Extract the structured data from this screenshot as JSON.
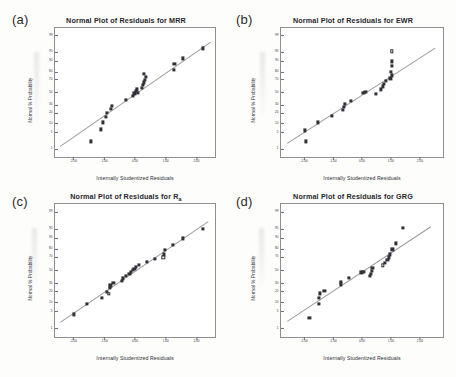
{
  "figure": {
    "background": "#fdfdfc",
    "marker_color": "#303036",
    "line_color": "#9a9aa0",
    "frame_color": "#8d8d92",
    "common_xlabel": "Internally Studentized Residuals",
    "common_ylabel": "Normal % Probability"
  },
  "chart_data": [
    {
      "type": "scatter",
      "panel": "(a)",
      "title": "Normal Plot of Residuals for MRR",
      "title_main": "Normal Plot of Residuals for MRR",
      "xlabel": "Internally Studentized Residuals",
      "ylabel": "Normal % Probability",
      "xlim": [
        -2.6,
        2.6
      ],
      "ylim": [
        0.4,
        99.6
      ],
      "yscale": "normal-probability",
      "grid": false,
      "legend": "none",
      "xticks": [
        "-2.00",
        "-1.00",
        "0.00",
        "1.00",
        "2.00"
      ],
      "xtickvals": [
        -2,
        -1,
        0,
        1,
        2
      ],
      "yticks": [
        "1",
        "5",
        "10",
        "20",
        "30",
        "50",
        "70",
        "80",
        "90",
        "95",
        "99"
      ],
      "ytickvals": [
        1,
        5,
        10,
        20,
        30,
        50,
        70,
        80,
        90,
        95,
        99
      ],
      "reference_line": {
        "x0": -2.45,
        "y0": 1.4,
        "x1": 2.45,
        "y1": 98.2
      },
      "points": [
        {
          "x": -1.42,
          "y": 2.2,
          "open": false
        },
        {
          "x": -1.1,
          "y": 6.5,
          "open": false
        },
        {
          "x": -1.05,
          "y": 11.0,
          "open": false
        },
        {
          "x": -0.94,
          "y": 16.0,
          "open": false
        },
        {
          "x": -0.9,
          "y": 20.5,
          "open": false
        },
        {
          "x": -0.78,
          "y": 25.0,
          "open": false
        },
        {
          "x": -0.74,
          "y": 29.0,
          "open": false
        },
        {
          "x": -0.3,
          "y": 38.0,
          "open": false
        },
        {
          "x": -0.08,
          "y": 44.0,
          "open": false
        },
        {
          "x": -0.02,
          "y": 48.5,
          "open": false
        },
        {
          "x": 0.02,
          "y": 52.0,
          "open": false
        },
        {
          "x": 0.05,
          "y": 55.0,
          "open": false
        },
        {
          "x": 0.1,
          "y": 50.0,
          "open": false
        },
        {
          "x": 0.22,
          "y": 58.0,
          "open": false
        },
        {
          "x": 0.26,
          "y": 62.0,
          "open": false
        },
        {
          "x": 0.3,
          "y": 66.0,
          "open": false
        },
        {
          "x": 0.33,
          "y": 70.0,
          "open": false
        },
        {
          "x": 0.35,
          "y": 74.0,
          "open": false
        },
        {
          "x": 0.28,
          "y": 78.0,
          "open": false
        },
        {
          "x": 1.26,
          "y": 82.0,
          "open": false
        },
        {
          "x": 1.28,
          "y": 88.0,
          "open": false
        },
        {
          "x": 1.55,
          "y": 92.0,
          "open": false
        },
        {
          "x": 2.22,
          "y": 96.5,
          "open": false
        }
      ]
    },
    {
      "type": "scatter",
      "panel": "(b)",
      "title": "Normal Plot of Residuals for EWR",
      "title_main": "Normal Plot of Residuals for EWR",
      "xlabel": "Internally Studentized Residuals",
      "ylabel": "Normal % Probability",
      "xlim": [
        -2.8,
        2.8
      ],
      "ylim": [
        0.4,
        99.6
      ],
      "yscale": "normal-probability",
      "grid": false,
      "legend": "none",
      "xticks": [
        "-2.00",
        "-1.00",
        "0.00",
        "1.00",
        "2.00"
      ],
      "xtickvals": [
        -2,
        -1,
        0,
        1,
        2
      ],
      "yticks": [
        "1",
        "5",
        "10",
        "20",
        "30",
        "50",
        "70",
        "80",
        "90",
        "95",
        "99"
      ],
      "ytickvals": [
        1,
        5,
        10,
        20,
        30,
        50,
        70,
        80,
        90,
        95,
        99
      ],
      "reference_line": {
        "x0": -2.6,
        "y0": 1.8,
        "x1": 2.5,
        "y1": 96.5
      },
      "points": [
        {
          "x": -1.95,
          "y": 2.2,
          "open": false
        },
        {
          "x": -1.98,
          "y": 6.0,
          "open": false
        },
        {
          "x": -1.52,
          "y": 11.0,
          "open": false
        },
        {
          "x": -1.05,
          "y": 16.5,
          "open": false
        },
        {
          "x": -0.66,
          "y": 24.0,
          "open": false
        },
        {
          "x": -0.62,
          "y": 28.0,
          "open": false
        },
        {
          "x": -0.6,
          "y": 32.0,
          "open": false
        },
        {
          "x": -0.38,
          "y": 37.0,
          "open": false
        },
        {
          "x": 0.05,
          "y": 50.0,
          "open": false
        },
        {
          "x": 0.12,
          "y": 50.5,
          "open": false
        },
        {
          "x": 0.48,
          "y": 48.0,
          "open": false
        },
        {
          "x": 0.66,
          "y": 55.0,
          "open": false
        },
        {
          "x": 0.72,
          "y": 60.0,
          "open": false
        },
        {
          "x": 0.76,
          "y": 64.0,
          "open": false
        },
        {
          "x": 0.82,
          "y": 68.0,
          "open": false
        },
        {
          "x": 0.98,
          "y": 72.0,
          "open": false
        },
        {
          "x": 1.02,
          "y": 76.0,
          "open": false
        },
        {
          "x": 1.0,
          "y": 80.0,
          "open": false
        },
        {
          "x": 1.04,
          "y": 86.0,
          "open": false
        },
        {
          "x": 1.02,
          "y": 90.0,
          "open": false
        },
        {
          "x": 1.03,
          "y": 95.5,
          "open": true
        }
      ]
    },
    {
      "type": "scatter",
      "panel": "(c)",
      "title": "Normal Plot of Residuals for Ra",
      "title_main": "Normal Plot of Residuals for R",
      "title_sub": "a",
      "xlabel": "Internally Studentized Residuals",
      "ylabel": "Normal % Probability",
      "xlim": [
        -2.6,
        2.6
      ],
      "ylim": [
        0.4,
        99.6
      ],
      "yscale": "normal-probability",
      "grid": false,
      "legend": "none",
      "xticks": [
        "-2.00",
        "-1.00",
        "0.00",
        "1.00",
        "2.00"
      ],
      "xtickvals": [
        -2,
        -1,
        0,
        1,
        2
      ],
      "yticks": [
        "1",
        "5",
        "10",
        "20",
        "30",
        "50",
        "70",
        "80",
        "90",
        "95",
        "99"
      ],
      "ytickvals": [
        1,
        5,
        10,
        20,
        30,
        50,
        70,
        80,
        90,
        95,
        99
      ],
      "reference_line": {
        "x0": -2.45,
        "y0": 2.0,
        "x1": 2.35,
        "y1": 97.5
      },
      "points": [
        {
          "x": -1.98,
          "y": 4.0,
          "open": false
        },
        {
          "x": -1.55,
          "y": 9.0,
          "open": false
        },
        {
          "x": -1.08,
          "y": 14.0,
          "open": false
        },
        {
          "x": -0.86,
          "y": 17.5,
          "open": true
        },
        {
          "x": -0.9,
          "y": 20.0,
          "open": false
        },
        {
          "x": -0.82,
          "y": 24.0,
          "open": false
        },
        {
          "x": -0.8,
          "y": 27.5,
          "open": false
        },
        {
          "x": -0.7,
          "y": 30.5,
          "open": false
        },
        {
          "x": -0.42,
          "y": 34.0,
          "open": false
        },
        {
          "x": -0.4,
          "y": 37.5,
          "open": false
        },
        {
          "x": -0.3,
          "y": 41.0,
          "open": false
        },
        {
          "x": -0.18,
          "y": 44.5,
          "open": false
        },
        {
          "x": -0.14,
          "y": 47.5,
          "open": false
        },
        {
          "x": -0.08,
          "y": 50.5,
          "open": false
        },
        {
          "x": -0.02,
          "y": 53.0,
          "open": false
        },
        {
          "x": 0.04,
          "y": 56.0,
          "open": false
        },
        {
          "x": 0.12,
          "y": 58.5,
          "open": false
        },
        {
          "x": 0.4,
          "y": 63.0,
          "open": false
        },
        {
          "x": 0.66,
          "y": 68.0,
          "open": false
        },
        {
          "x": 0.92,
          "y": 70.0,
          "open": true
        },
        {
          "x": 0.95,
          "y": 74.0,
          "open": false
        },
        {
          "x": 0.98,
          "y": 79.0,
          "open": false
        },
        {
          "x": 1.22,
          "y": 85.0,
          "open": false
        },
        {
          "x": 1.55,
          "y": 90.0,
          "open": false
        },
        {
          "x": 2.22,
          "y": 95.0,
          "open": false
        }
      ]
    },
    {
      "type": "scatter",
      "panel": "(d)",
      "title": "Normal Plot of Residuals for GRG",
      "title_main": "Normal Plot of Residuals for GRG",
      "xlabel": "Internally Studentized Residuals",
      "ylabel": "Normal % Probability",
      "xlim": [
        -2.8,
        2.8
      ],
      "ylim": [
        0.4,
        99.6
      ],
      "yscale": "normal-probability",
      "grid": false,
      "legend": "none",
      "xticks": [
        "-2.00",
        "-1.00",
        "0.00",
        "1.00",
        "2.00"
      ],
      "xtickvals": [
        -2,
        -1,
        0,
        1,
        2
      ],
      "yticks": [
        "1",
        "5",
        "10",
        "20",
        "30",
        "50",
        "70",
        "80",
        "90",
        "95",
        "99"
      ],
      "ytickvals": [
        1,
        5,
        10,
        20,
        30,
        50,
        70,
        80,
        90,
        95,
        99
      ],
      "reference_line": {
        "x0": -2.6,
        "y0": 2.2,
        "x1": 2.35,
        "y1": 96.0
      },
      "points": [
        {
          "x": -1.82,
          "y": 3.0,
          "open": false
        },
        {
          "x": -1.48,
          "y": 9.0,
          "open": false
        },
        {
          "x": -1.5,
          "y": 14.0,
          "open": false
        },
        {
          "x": -1.45,
          "y": 18.0,
          "open": false
        },
        {
          "x": -1.3,
          "y": 21.0,
          "open": false
        },
        {
          "x": -0.74,
          "y": 29.0,
          "open": false
        },
        {
          "x": -0.72,
          "y": 33.0,
          "open": false
        },
        {
          "x": -0.45,
          "y": 38.0,
          "open": false
        },
        {
          "x": -0.02,
          "y": 47.0,
          "open": false
        },
        {
          "x": 0.05,
          "y": 47.5,
          "open": false
        },
        {
          "x": 0.28,
          "y": 41.0,
          "open": false
        },
        {
          "x": 0.3,
          "y": 44.5,
          "open": false
        },
        {
          "x": 0.34,
          "y": 50.0,
          "open": false
        },
        {
          "x": 0.36,
          "y": 53.5,
          "open": false
        },
        {
          "x": 0.72,
          "y": 58.0,
          "open": true
        },
        {
          "x": 0.78,
          "y": 62.0,
          "open": false
        },
        {
          "x": 0.88,
          "y": 66.0,
          "open": false
        },
        {
          "x": 0.92,
          "y": 70.0,
          "open": false
        },
        {
          "x": 0.96,
          "y": 74.0,
          "open": false
        },
        {
          "x": 1.05,
          "y": 80.0,
          "open": false
        },
        {
          "x": 1.18,
          "y": 86.0,
          "open": false
        },
        {
          "x": 1.42,
          "y": 95.5,
          "open": false
        }
      ]
    }
  ]
}
